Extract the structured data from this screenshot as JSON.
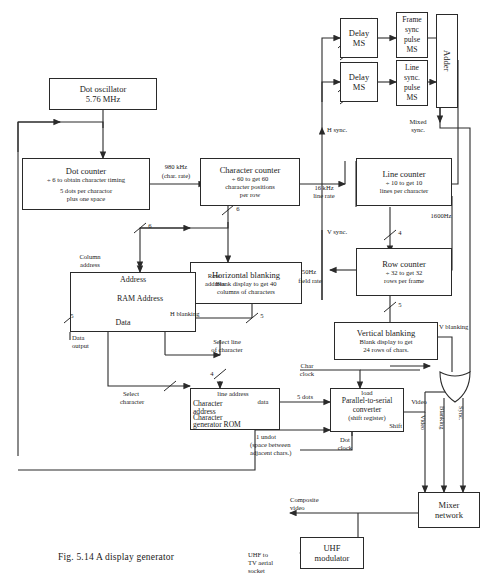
{
  "figure": {
    "caption": "Fig. 5.14  A display generator"
  },
  "blocks": {
    "dot_oscillator": {
      "title": "Dot oscillator",
      "line2": "5.76 MHz"
    },
    "dot_counter": {
      "title": "Dot counter",
      "line2": "÷ 6 to obtain character timing",
      "line3": "5 dots per charactor",
      "line4": "plus one space"
    },
    "character_counter": {
      "title": "Character counter",
      "line2": "÷ 60 to get 60",
      "line3": "character positions",
      "line4": "per row"
    },
    "line_counter": {
      "title": "Line counter",
      "line2": "÷ 10 to get 10",
      "line3": "lines per character"
    },
    "row_counter": {
      "title": "Row counter",
      "line2": "÷ 32 to get 32",
      "line3": "rows per frame"
    },
    "horizontal_blanking": {
      "title": "Horizontal blanking",
      "line2": "Blank display to get 40",
      "line3": "columns of characters"
    },
    "vertical_blanking": {
      "title": "Vertical blanking",
      "line2": "Blank display to get",
      "line3": "24 rows of chars."
    },
    "ram": {
      "address_top": "Address",
      "center": "RAM   Address",
      "data": "Data"
    },
    "char_gen_rom": {
      "line_address": "line address",
      "character": "Character",
      "address": "address",
      "character2": "Character",
      "generator_rom": "generator ROM",
      "data": "data"
    },
    "delay_ms_1": {
      "line1": "Delay",
      "line2": "MS"
    },
    "delay_ms_2": {
      "line1": "Delay",
      "line2": "MS"
    },
    "frame_sync_pulse": {
      "line1": "Frame",
      "line2": "sync",
      "line3": "pulse",
      "line4": "MS"
    },
    "line_sync_pulse": {
      "line1": "Line",
      "line2": "sync.",
      "line3": "pulse",
      "line4": "MS"
    },
    "adder": {
      "title": "Adder"
    },
    "parallel_to_serial": {
      "load": "load",
      "title": "Parallel-to-serial",
      "line2": "converter",
      "line3": "(shift register)",
      "shift": "Shift"
    },
    "mixer_network": {
      "line1": "Mixer",
      "line2": "network"
    },
    "uhf_modulator": {
      "line1": "UHF",
      "line2": "modulator"
    }
  },
  "signals": {
    "rate_980khz": "980 kHz",
    "char_rate": "(char. rate)",
    "rate_16khz": "16 kHz",
    "line_rate": "line rate",
    "rate_50hz": "50Hz",
    "field_rate": "field rate",
    "rate_1600hz": "1600Hz",
    "h_sync": "H sync.",
    "v_sync": "V sync.",
    "mixed_sync_1": "Mixed",
    "mixed_sync_2": "sync.",
    "h_blanking": "H blanking",
    "v_blanking": "V blanking",
    "column_address_1": "Column",
    "column_address_2": "address",
    "row_address_1": "Row",
    "row_address_2": "address",
    "data_output_1": "Data",
    "data_output_2": "output",
    "select_line_1": "Select line",
    "select_line_2": "of character",
    "select_character_1": "Select",
    "select_character_2": "character",
    "char_clock_1": "Char",
    "char_clock_2": "clock",
    "dot_clock_1": "Dot",
    "dot_clock_2": "clock",
    "five_dots": "5 dots",
    "one_undot_1": "1 undot",
    "one_undot_2": "(space between",
    "one_undot_3": "adjacent chars.)",
    "video": "Video",
    "video_vert": "Video",
    "blanking_vert": "Blanking",
    "sync_vert": "Sync.",
    "composite_video_1": "Composite",
    "composite_video_2": "video",
    "uhf_out_1": "UHF to",
    "uhf_out_2": "TV aerial",
    "uhf_out_3": "socket"
  },
  "bus_widths": {
    "column_bus": "6",
    "char_counter_bus": "6",
    "line_counter_bus": "4",
    "row_counter_bus": "5",
    "row_address_bus": "5",
    "select_line_bus": "4",
    "select_char_bus": "5"
  },
  "colors": {
    "line": "#2a2a2a",
    "background": "#ffffff",
    "text": "#1b1b1b"
  }
}
